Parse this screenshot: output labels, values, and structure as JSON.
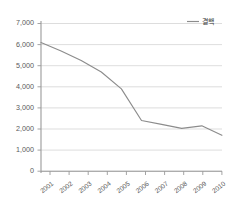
{
  "chart_data": {
    "type": "line",
    "title": "",
    "subtitle": "",
    "xlabel": "",
    "ylabel": "",
    "categories": [
      "2001",
      "2002",
      "2003",
      "2004",
      "2005",
      "2006",
      "2007",
      "2008",
      "2009",
      "2010"
    ],
    "series": [
      {
        "name": "결핵",
        "values": [
          6100,
          5700,
          5250,
          4700,
          3900,
          2400,
          2220,
          2030,
          2150,
          1700
        ],
        "color": "#8c8c8c"
      }
    ],
    "ylim": [
      0,
      7000
    ],
    "ytick_step": 1000,
    "ytick_labels": [
      "0",
      "1,000",
      "2,000",
      "3,000",
      "4,000",
      "5,000",
      "6,000",
      "7,000"
    ],
    "ytick_values": [
      0,
      1000,
      2000,
      3000,
      4000,
      5000,
      6000,
      7000
    ],
    "xtick_labels": [
      "2001",
      "2002",
      "2003",
      "2004",
      "2005",
      "2006",
      "2007",
      "2008",
      "2009",
      "2010"
    ],
    "grid": "horizontal",
    "legend_position": "top-right",
    "legend_entries": [
      "결핵"
    ],
    "background_color": "#ffffff",
    "grid_color": "#d4d4d4",
    "axis_color": "#9a9a9a",
    "tick_label_color": "#5a5a5a"
  },
  "legend": {
    "entry_label": "결핵"
  }
}
